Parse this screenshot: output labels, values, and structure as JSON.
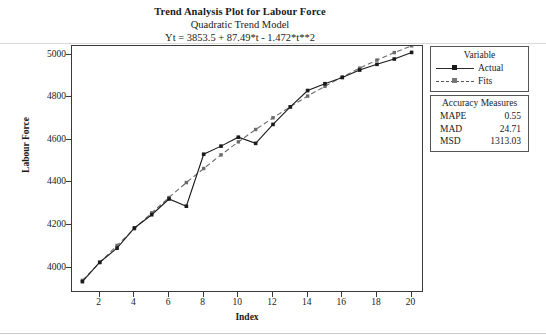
{
  "chart_data": {
    "type": "line",
    "title": "Trend Analysis Plot for Labour Force",
    "subtitle": "Quadratic Trend Model",
    "equation": "Yt = 3853.5 + 87.49*t - 1.472*t**2",
    "xlabel": "Index",
    "ylabel": "Labour Force",
    "xlim": [
      0.4,
      20.6
    ],
    "ylim": [
      3890,
      5040
    ],
    "xticks": [
      2,
      4,
      6,
      8,
      10,
      12,
      14,
      16,
      18,
      20
    ],
    "yticks": [
      4000,
      4200,
      4400,
      4600,
      4800,
      5000
    ],
    "grid": false,
    "legend_position": "right",
    "x": [
      1,
      2,
      3,
      4,
      5,
      6,
      7,
      8,
      9,
      10,
      11,
      12,
      13,
      14,
      15,
      16,
      17,
      18,
      19,
      20
    ],
    "series": [
      {
        "name": "Actual",
        "style": "solid",
        "marker": "filled-square",
        "color": "#1a1a1a",
        "values": [
          3934,
          4025,
          4091,
          4186,
          4248,
          4322,
          4288,
          4532,
          4570,
          4612,
          4583,
          4672,
          4754,
          4831,
          4863,
          4892,
          4927,
          4954,
          4979,
          5010
        ]
      },
      {
        "name": "Fits",
        "style": "dashed",
        "marker": "square",
        "color": "#6a6a6a",
        "values": [
          3940,
          4023,
          4104,
          4182,
          4257,
          4329,
          4399,
          4465,
          4529,
          4590,
          4648,
          4703,
          4755,
          4805,
          4851,
          4895,
          4936,
          4974,
          5009,
          5041
        ]
      }
    ]
  },
  "legend": {
    "title": "Variable",
    "items": [
      {
        "label": "Actual"
      },
      {
        "label": "Fits"
      }
    ]
  },
  "accuracy": {
    "title": "Accuracy Measures",
    "rows": [
      {
        "name": "MAPE",
        "value": "0.55"
      },
      {
        "name": "MAD",
        "value": "24.71"
      },
      {
        "name": "MSD",
        "value": "1313.03"
      }
    ]
  }
}
